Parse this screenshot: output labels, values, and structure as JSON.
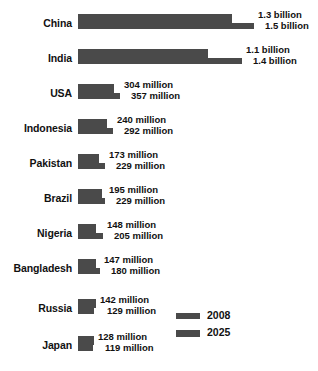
{
  "chart_data": {
    "type": "bar",
    "title": "",
    "xlabel": "",
    "ylabel": "",
    "orientation": "horizontal",
    "grid": false,
    "legend_position": "bottom-right",
    "unit_note": "Population; values shown as labels in billions or millions",
    "categories": [
      "China",
      "India",
      "USA",
      "Indonesia",
      "Pakistan",
      "Brazil",
      "Nigeria",
      "Bangladesh",
      "Russia",
      "Japan"
    ],
    "series": [
      {
        "name": "2008",
        "values": [
          1300000000,
          1100000000,
          304000000,
          240000000,
          173000000,
          195000000,
          148000000,
          147000000,
          142000000,
          128000000
        ],
        "labels": [
          "1.3 billion",
          "1.1 billion",
          "304 million",
          "240 million",
          "173 million",
          "195 million",
          "148 million",
          "147 million",
          "142 million",
          "128 million"
        ]
      },
      {
        "name": "2025",
        "values": [
          1500000000,
          1400000000,
          357000000,
          292000000,
          229000000,
          229000000,
          205000000,
          180000000,
          129000000,
          119000000
        ],
        "labels": [
          "1.5 billion",
          "1.4 billion",
          "357 million",
          "292 million",
          "229 million",
          "229 million",
          "205 million",
          "180 million",
          "129 million",
          "119 million"
        ]
      }
    ],
    "xlim": [
      0,
      1500000000
    ]
  },
  "rows": [
    {
      "country": "China",
      "label_2008": "1.3 billion",
      "label_2025": "1.5 billion",
      "bar2008_px": 154,
      "bar2025_px": 176
    },
    {
      "country": "India",
      "label_2008": "1.1 billion",
      "label_2025": "1.4 billion",
      "bar2008_px": 130,
      "bar2025_px": 164
    },
    {
      "country": "USA",
      "label_2008": "304 million",
      "label_2025": "357 million",
      "bar2008_px": 36,
      "bar2025_px": 42
    },
    {
      "country": "Indonesia",
      "label_2008": "240 million",
      "label_2025": "292 million",
      "bar2008_px": 29,
      "bar2025_px": 35
    },
    {
      "country": "Pakistan",
      "label_2008": "173 million",
      "label_2025": "229 million",
      "bar2008_px": 21,
      "bar2025_px": 27
    },
    {
      "country": "Brazil",
      "label_2008": "195 million",
      "label_2025": "229 million",
      "bar2008_px": 24,
      "bar2025_px": 27
    },
    {
      "country": "Nigeria",
      "label_2008": "148 million",
      "label_2025": "205 million",
      "bar2008_px": 18,
      "bar2025_px": 25
    },
    {
      "country": "Bangladesh",
      "label_2008": "147 million",
      "label_2025": "180 million",
      "bar2008_px": 18,
      "bar2025_px": 22
    },
    {
      "country": "Russia",
      "label_2008": "142 million",
      "label_2025": "129 million",
      "bar2008_px": 18,
      "bar2025_px": 16
    },
    {
      "country": "Japan",
      "label_2008": "128 million",
      "label_2025": "119 million",
      "bar2008_px": 16,
      "bar2025_px": 15
    }
  ],
  "legend": {
    "items": [
      {
        "label": "2008"
      },
      {
        "label": "2025"
      }
    ]
  },
  "colors": {
    "bar": "#4a4a4a",
    "text": "#111111",
    "background": "#ffffff"
  }
}
